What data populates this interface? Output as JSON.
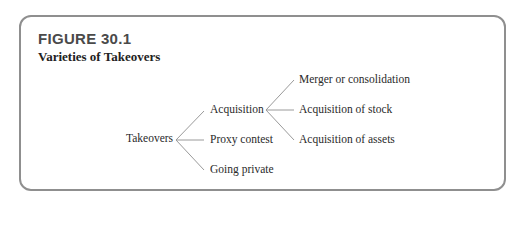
{
  "figure": {
    "label": "FIGURE 30.1",
    "title": "Varieties of Takeovers"
  },
  "tree": {
    "root": "Takeovers",
    "level1": [
      "Acquisition",
      "Proxy contest",
      "Going private"
    ],
    "level2": [
      "Merger or consolidation",
      "Acquisition of stock",
      "Acquisition of assets"
    ]
  },
  "colors": {
    "frame": "#8f8f8f",
    "lines": "#9a9a9a",
    "text": "#2a2a2a"
  }
}
